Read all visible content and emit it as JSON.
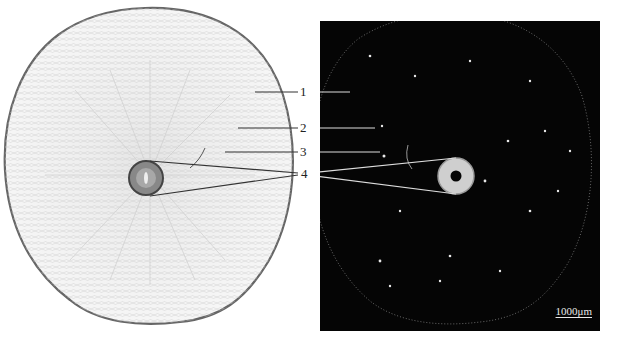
{
  "figure": {
    "labels": [
      {
        "id": "1",
        "text": "1"
      },
      {
        "id": "2",
        "text": "2"
      },
      {
        "id": "3",
        "text": "3"
      },
      {
        "id": "4",
        "text": "4"
      }
    ],
    "scale_bar": {
      "text": "1000μm"
    },
    "colors": {
      "left_background": "#ffffff",
      "left_tissue": "#f2f2f2",
      "left_outline": "#555555",
      "right_background": "#050505",
      "right_tissue_glow": "#d8d8d8",
      "leader_lines_left": "#333333",
      "leader_lines_right": "#dddddd"
    }
  }
}
